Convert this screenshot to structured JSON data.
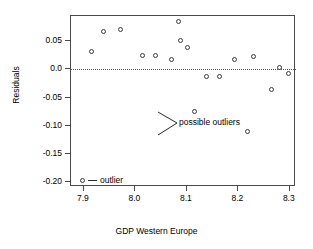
{
  "chart_data": {
    "type": "scatter",
    "title": "",
    "xlabel": "GDP Western Europe",
    "ylabel": "Residuals",
    "xlim": [
      7.875,
      8.312
    ],
    "ylim": [
      -0.208,
      0.0945
    ],
    "grid": false,
    "legend_position": "inside-bottom-left",
    "xticks": [
      7.9,
      8.0,
      8.1,
      8.2,
      8.3
    ],
    "xticklabels": [
      "7.9",
      "8.0",
      "8.1",
      "8.2",
      "8.3"
    ],
    "yticks": [
      0.05,
      0.0,
      -0.05,
      -0.1,
      -0.15,
      -0.2
    ],
    "yticklabels": [
      "0.05",
      "0.0",
      "-0.05",
      "-0.10",
      "-0.15",
      "-0.20"
    ],
    "reference_line": {
      "y": 0.0,
      "style": "dotted"
    },
    "x": [
      7.915,
      7.938,
      7.972,
      8.013,
      8.04,
      8.07,
      8.084,
      8.088,
      8.101,
      8.114,
      8.139,
      8.163,
      8.192,
      8.217,
      8.23,
      8.264,
      8.28,
      8.298
    ],
    "y": [
      0.032,
      0.067,
      0.07,
      0.024,
      0.025,
      0.018,
      0.084,
      0.051,
      0.038,
      -0.075,
      -0.013,
      -0.012,
      0.017,
      -0.11,
      0.023,
      -0.035,
      0.004,
      -0.007
    ],
    "marker": "open-circle",
    "annotations": [
      {
        "text": "possible outliers",
        "points": [
          [
            8.114,
            -0.075
          ],
          [
            8.217,
            -0.11
          ]
        ]
      },
      {
        "text": "outlier",
        "marker": "open-circle",
        "dash": true
      }
    ]
  },
  "axes": {
    "ylabel": "Residuals",
    "xlabel": "GDP Western Europe"
  },
  "annotation": {
    "possible_outliers": "possible outliers",
    "outlier_legend": "outlier"
  }
}
